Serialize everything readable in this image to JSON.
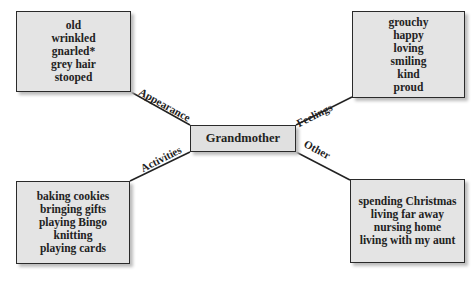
{
  "center": {
    "label": "Grandmother"
  },
  "branches": {
    "appearance": {
      "label": "Appearance",
      "items": [
        "old",
        "wrinkled",
        "gnarled*",
        "grey hair",
        "stooped"
      ]
    },
    "feelings": {
      "label": "Feelings",
      "items": [
        "grouchy",
        "happy",
        "loving",
        "smiling",
        "kind",
        "proud"
      ]
    },
    "activities": {
      "label": "Activities",
      "items": [
        "baking cookies",
        "bringing gifts",
        "playing Bingo",
        "knitting",
        "playing cards"
      ]
    },
    "other": {
      "label": "Other",
      "items": [
        "spending Christmas",
        "living far away",
        "nursing home",
        "living with my aunt"
      ]
    }
  }
}
